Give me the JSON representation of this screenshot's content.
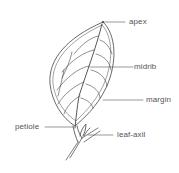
{
  "diagram": {
    "line_color": "#555555",
    "labels": [
      {
        "id": "apex",
        "text": "apex",
        "x": 129,
        "y": 17
      },
      {
        "id": "midrib",
        "text": "midrib",
        "x": 134,
        "y": 62
      },
      {
        "id": "margin",
        "text": "margin",
        "x": 146,
        "y": 95
      },
      {
        "id": "petiole",
        "text": "petiole",
        "x": 15,
        "y": 122
      },
      {
        "id": "leaf-axil",
        "text": "leaf-axil",
        "x": 117,
        "y": 130
      }
    ]
  }
}
